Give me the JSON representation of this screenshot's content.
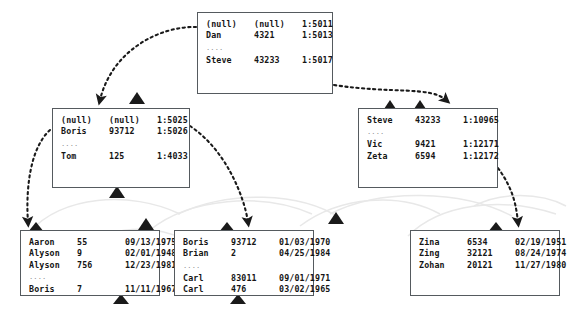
{
  "diagram": {
    "title_text": "",
    "colors": {
      "node_border": "#555a5e",
      "node_fill": "#ffffff",
      "text": "#151515",
      "ellipsis": "#8d8d8d",
      "arrow": "#1a1a1a",
      "ghost_arc": "#e6e6e6"
    },
    "nodes": [
      {
        "id": "node-root",
        "name": "root-index-node",
        "rows": [
          {
            "a": "(null)",
            "b": "(null)",
            "c": "1:5011",
            "ellipsis": false
          },
          {
            "a": "Dan",
            "b": "4321",
            "c": "1:5013",
            "ellipsis": false
          },
          {
            "a": "....",
            "b": "",
            "c": "",
            "ellipsis": true
          },
          {
            "a": "Steve",
            "b": "43233",
            "c": "1:5017",
            "ellipsis": false
          }
        ]
      },
      {
        "id": "node-mid-left",
        "name": "intermediate-index-node-left",
        "rows": [
          {
            "a": "(null)",
            "b": "(null)",
            "c": "1:5025",
            "ellipsis": false
          },
          {
            "a": "Boris",
            "b": "93712",
            "c": "1:5026",
            "ellipsis": false
          },
          {
            "a": "....",
            "b": "",
            "c": "",
            "ellipsis": true
          },
          {
            "a": "Tom",
            "b": "125",
            "c": "1:4033",
            "ellipsis": false
          }
        ]
      },
      {
        "id": "node-mid-right",
        "name": "intermediate-index-node-right",
        "rows": [
          {
            "a": "Steve",
            "b": "43233",
            "c": "1:10965",
            "ellipsis": false
          },
          {
            "a": "....",
            "b": "",
            "c": "",
            "ellipsis": true
          },
          {
            "a": "Vic",
            "b": "9421",
            "c": "1:12171",
            "ellipsis": false
          },
          {
            "a": "Zeta",
            "b": "6594",
            "c": "1:12172",
            "ellipsis": false
          }
        ]
      },
      {
        "id": "node-leaf-1",
        "name": "leaf-data-node-1",
        "rows": [
          {
            "a": "Aaron",
            "b": "55",
            "c": "09/13/1975",
            "ellipsis": false
          },
          {
            "a": "Alyson",
            "b": "9",
            "c": "02/01/1948",
            "ellipsis": false
          },
          {
            "a": "Alyson",
            "b": "756",
            "c": "12/23/1981",
            "ellipsis": false
          },
          {
            "a": "....",
            "b": "",
            "c": "",
            "ellipsis": true
          },
          {
            "a": "Boris",
            "b": "7",
            "c": "11/11/1967",
            "ellipsis": false
          }
        ]
      },
      {
        "id": "node-leaf-2",
        "name": "leaf-data-node-2",
        "rows": [
          {
            "a": "Boris",
            "b": "93712",
            "c": "01/03/1970",
            "ellipsis": false
          },
          {
            "a": "Brian",
            "b": "2",
            "c": "04/25/1984",
            "ellipsis": false
          },
          {
            "a": "....",
            "b": "",
            "c": "",
            "ellipsis": true
          },
          {
            "a": "Carl",
            "b": "83011",
            "c": "09/01/1971",
            "ellipsis": false
          },
          {
            "a": "Carl",
            "b": "476",
            "c": "03/02/1965",
            "ellipsis": false
          }
        ]
      },
      {
        "id": "node-leaf-3",
        "name": "leaf-data-node-3",
        "rows": [
          {
            "a": "Zina",
            "b": "6534",
            "c": "02/19/1951",
            "ellipsis": false
          },
          {
            "a": "Zing",
            "b": "32121",
            "c": "08/24/1974",
            "ellipsis": false
          },
          {
            "a": "Zohan",
            "b": "20121",
            "c": "11/27/1980",
            "ellipsis": false
          }
        ]
      }
    ]
  }
}
